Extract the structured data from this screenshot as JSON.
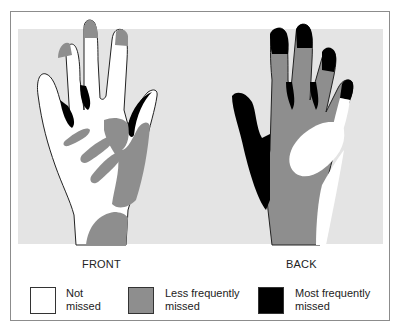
{
  "figure": {
    "views": [
      {
        "label": "FRONT"
      },
      {
        "label": "BACK"
      }
    ],
    "legend": [
      {
        "label": "Not\nmissed",
        "color": "#ffffff"
      },
      {
        "label": "Less frequently\nmissed",
        "color": "#8e8e8e"
      },
      {
        "label": "Most frequently\nmissed",
        "color": "#000000"
      }
    ],
    "colors": {
      "background_panel": "#e4e4e4",
      "not_missed": "#ffffff",
      "less_frequently_missed": "#8e8e8e",
      "most_frequently_missed": "#000000"
    }
  }
}
